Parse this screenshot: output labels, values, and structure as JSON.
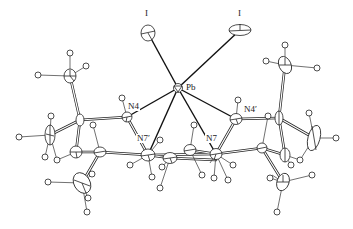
{
  "diagram": {
    "type": "ORTEP molecular structure",
    "colors": {
      "ink": "#1a1a1a",
      "background": "#ffffff"
    },
    "labels": {
      "iodine_left": "I",
      "iodine_right": "I",
      "lead": "Pb",
      "n4": "N4",
      "n4_prime": "N4′",
      "n7_prime": "N7′",
      "n7": "N7"
    },
    "atoms": [
      {
        "id": "I1",
        "element": "I",
        "x": 148,
        "y": 33
      },
      {
        "id": "I2",
        "element": "I",
        "x": 240,
        "y": 30
      },
      {
        "id": "Pb",
        "element": "Pb",
        "x": 178,
        "y": 88
      },
      {
        "id": "N4",
        "element": "N",
        "x": 127,
        "y": 117
      },
      {
        "id": "N4p",
        "element": "N",
        "x": 236,
        "y": 119
      },
      {
        "id": "N7p",
        "element": "N",
        "x": 148,
        "y": 155
      },
      {
        "id": "N7",
        "element": "N",
        "x": 216,
        "y": 154
      }
    ],
    "pb_bonds": [
      "I1",
      "I2",
      "N4",
      "N4p",
      "N7p",
      "N7"
    ]
  }
}
